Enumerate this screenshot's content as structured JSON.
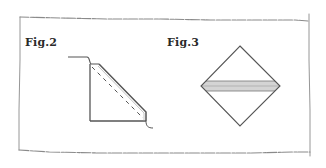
{
  "figures": [
    {
      "id": "fig2",
      "label": "Fig.2",
      "description": "Folded corner shape with dashed fold line"
    },
    {
      "id": "fig3",
      "label": "Fig.3",
      "description": "Diamond (square rotated 45 degrees) with horizontal shaded band across the middle"
    }
  ],
  "colors": {
    "line": "#555555",
    "border": "#8a8a8a",
    "band_fill": "#d4d4d4",
    "text": "#2a2a2a",
    "background": "#ffffff"
  }
}
